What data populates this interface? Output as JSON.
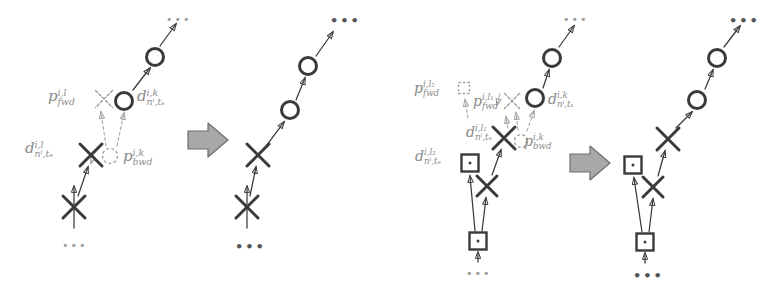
{
  "figure": {
    "background": "#ffffff",
    "stroke_solid": "#3a3a3a",
    "stroke_ghost": "#9d9d9d",
    "label_color": "#8a8a8a",
    "block_arrow_fill": "#a8a8a8",
    "block_arrow_stroke": "#6e6e6e",
    "ellipsis": "•••"
  },
  "diagrams": [
    {
      "id": "diagram-1",
      "name": "single-hypothesis-insertion",
      "before": {
        "name": "before-panel-1",
        "markers": [
          {
            "kind": "cross",
            "style": "solid",
            "x": 74,
            "y": 207,
            "size": 22
          },
          {
            "kind": "cross",
            "style": "solid",
            "x": 91,
            "y": 155,
            "size": 22
          },
          {
            "kind": "circle",
            "style": "solid",
            "x": 124,
            "y": 101,
            "size": 17
          },
          {
            "kind": "circle",
            "style": "solid",
            "x": 155,
            "y": 57,
            "size": 17
          },
          {
            "kind": "cross",
            "style": "ghost",
            "x": 104,
            "y": 99,
            "size": 17
          },
          {
            "kind": "circle",
            "style": "ghost",
            "x": 110,
            "y": 156,
            "size": 15
          }
        ],
        "links": [
          {
            "style": "solid",
            "from": [
              74,
              228
            ],
            "to": [
              74,
              186
            ]
          },
          {
            "style": "solid",
            "from": [
              78,
              196
            ],
            "to": [
              88,
              167
            ]
          },
          {
            "style": "solid",
            "from": [
              133,
              90
            ],
            "to": [
              150,
              68
            ]
          },
          {
            "style": "solid",
            "from": [
              160,
              46
            ],
            "to": [
              176,
              24
            ]
          },
          {
            "style": "dashed",
            "from": [
              106,
              146
            ],
            "to": [
              101,
              112
            ]
          },
          {
            "style": "dashed",
            "from": [
              117,
              146
            ],
            "to": [
              124,
              113
            ]
          },
          {
            "style": "dashed",
            "from": [
              96,
              150
            ],
            "to": [
              91,
              163
            ]
          }
        ],
        "ellipses": [
          {
            "x": 62,
            "y": 240,
            "variant": "faint"
          },
          {
            "x": 166,
            "y": 14,
            "variant": "faint"
          }
        ],
        "labels": [
          {
            "name": "p-fwd-label",
            "base": "p",
            "sup": "i,l",
            "sub": "fwd",
            "x": 48,
            "y": 88,
            "size": 15
          },
          {
            "name": "d-start-label",
            "base": "d",
            "sup": "i,k",
            "sub": "nⁱ,tₛ",
            "x": 137,
            "y": 88,
            "size": 15
          },
          {
            "name": "d-end-label",
            "base": "d",
            "sup": "i,l",
            "sub": "nⁱ,tₑ",
            "x": 25,
            "y": 140,
            "size": 15
          },
          {
            "name": "p-bwd-label",
            "base": "p",
            "sup": "i,k",
            "sub": "bwd",
            "x": 123,
            "y": 148,
            "size": 15
          }
        ]
      },
      "block_arrow": {
        "name": "transform-arrow-1",
        "x": 188,
        "y": 140
      },
      "after": {
        "name": "after-panel-1",
        "markers": [
          {
            "kind": "cross",
            "style": "solid",
            "x": 247,
            "y": 207,
            "size": 22
          },
          {
            "kind": "cross",
            "style": "solid",
            "x": 258,
            "y": 155,
            "size": 22
          },
          {
            "kind": "circle",
            "style": "solid",
            "x": 290,
            "y": 110,
            "size": 17
          },
          {
            "kind": "circle",
            "style": "solid",
            "x": 308,
            "y": 66,
            "size": 17
          },
          {
            "kind": "circle",
            "style": "solid",
            "x": 308,
            "y": 66,
            "size": 0
          }
        ],
        "links": [
          {
            "style": "solid",
            "from": [
              247,
              228
            ],
            "to": [
              247,
              186
            ]
          },
          {
            "style": "solid",
            "from": [
              250,
              196
            ],
            "to": [
              256,
              167
            ]
          },
          {
            "style": "solid",
            "from": [
              266,
              146
            ],
            "to": [
              284,
              122
            ]
          },
          {
            "style": "solid",
            "from": [
              296,
              100
            ],
            "to": [
              305,
              78
            ]
          },
          {
            "style": "solid",
            "from": [
              316,
              56
            ],
            "to": [
              333,
              32
            ]
          }
        ],
        "ellipses": [
          {
            "x": 235,
            "y": 240,
            "variant": "bold"
          },
          {
            "x": 330,
            "y": 14,
            "variant": "bold"
          }
        ],
        "labels": []
      }
    },
    {
      "id": "diagram-2",
      "name": "multi-hypothesis-branch-insertion",
      "before": {
        "name": "before-panel-2",
        "markers": [
          {
            "kind": "square",
            "style": "solid",
            "x": 478,
            "y": 241,
            "size": 17
          },
          {
            "kind": "cross",
            "style": "solid",
            "x": 487,
            "y": 186,
            "size": 20
          },
          {
            "kind": "square",
            "style": "solid",
            "x": 470,
            "y": 163,
            "size": 17
          },
          {
            "kind": "cross",
            "style": "solid",
            "x": 504,
            "y": 138,
            "size": 22
          },
          {
            "kind": "circle",
            "style": "solid",
            "x": 535,
            "y": 98,
            "size": 17
          },
          {
            "kind": "circle",
            "style": "solid",
            "x": 552,
            "y": 58,
            "size": 17
          },
          {
            "kind": "square",
            "style": "ghost",
            "x": 464,
            "y": 88,
            "size": 11
          },
          {
            "kind": "cross",
            "style": "ghost",
            "x": 512,
            "y": 101,
            "size": 15
          },
          {
            "kind": "circle",
            "style": "ghost",
            "x": 521,
            "y": 141,
            "size": 13
          }
        ],
        "links": [
          {
            "style": "solid",
            "from": [
              478,
              262
            ],
            "to": [
              478,
              252
            ]
          },
          {
            "style": "solid",
            "from": [
              475,
              231
            ],
            "to": [
              470,
              176
            ]
          },
          {
            "style": "solid",
            "from": [
              482,
              231
            ],
            "to": [
              486,
              198
            ]
          },
          {
            "style": "solid",
            "from": [
              492,
              175
            ],
            "to": [
              501,
              150
            ]
          },
          {
            "style": "solid",
            "from": [
              543,
              88
            ],
            "to": [
              549,
              70
            ]
          },
          {
            "style": "solid",
            "from": [
              559,
              47
            ],
            "to": [
              574,
              26
            ]
          },
          {
            "style": "dashed",
            "from": [
              518,
              130
            ],
            "to": [
              516,
              113
            ]
          },
          {
            "style": "dashed",
            "from": [
              527,
              131
            ],
            "to": [
              534,
              111
            ]
          },
          {
            "style": "dashed",
            "from": [
              508,
              128
            ],
            "to": [
              506,
              117
            ]
          },
          {
            "style": "dashed",
            "from": [
              468,
              118
            ],
            "to": [
              465,
              100
            ]
          },
          {
            "style": "dashed",
            "from": [
              500,
              94
            ],
            "to": [
              497,
              105
            ]
          }
        ],
        "ellipses": [
          {
            "x": 466,
            "y": 268,
            "variant": "faint"
          },
          {
            "x": 563,
            "y": 14,
            "variant": "faint"
          }
        ],
        "labels": [
          {
            "name": "p-fwd-l2-label",
            "base": "p",
            "sup": "i,l₂",
            "sub": "fwd",
            "x": 414,
            "y": 80,
            "size": 14
          },
          {
            "name": "p-fwd-l1-label",
            "base": "p",
            "sup": "i,l₁",
            "sub": "fwd",
            "x": 473,
            "y": 93,
            "size": 14
          },
          {
            "name": "d-start-label-2",
            "base": "d",
            "sup": "i,k",
            "sub": "nⁱ,tₛ",
            "x": 548,
            "y": 91,
            "size": 14
          },
          {
            "name": "d-end-l1-label",
            "base": "d",
            "sup": "i,l₁",
            "sub": "nⁱ,tₑ",
            "x": 466,
            "y": 124,
            "size": 14
          },
          {
            "name": "p-bwd-label-2",
            "base": "p",
            "sup": "i,k",
            "sub": "bwd",
            "x": 524,
            "y": 133,
            "size": 14
          },
          {
            "name": "d-end-l2-label",
            "base": "d",
            "sup": "i,l₂",
            "sub": "nⁱ,tₑ",
            "x": 415,
            "y": 148,
            "size": 14
          }
        ]
      },
      "block_arrow": {
        "name": "transform-arrow-2",
        "x": 570,
        "y": 163
      },
      "after": {
        "name": "after-panel-2",
        "markers": [
          {
            "kind": "square",
            "style": "solid",
            "x": 645,
            "y": 242,
            "size": 17
          },
          {
            "kind": "cross",
            "style": "solid",
            "x": 653,
            "y": 187,
            "size": 20
          },
          {
            "kind": "square",
            "style": "solid",
            "x": 633,
            "y": 165,
            "size": 17
          },
          {
            "kind": "cross",
            "style": "solid",
            "x": 668,
            "y": 139,
            "size": 22
          },
          {
            "kind": "circle",
            "style": "solid",
            "x": 697,
            "y": 100,
            "size": 17
          },
          {
            "kind": "circle",
            "style": "solid",
            "x": 717,
            "y": 58,
            "size": 17
          }
        ],
        "links": [
          {
            "style": "solid",
            "from": [
              645,
              263
            ],
            "to": [
              645,
              253
            ]
          },
          {
            "style": "solid",
            "from": [
              642,
              232
            ],
            "to": [
              634,
              178
            ]
          },
          {
            "style": "solid",
            "from": [
              649,
              232
            ],
            "to": [
              653,
              199
            ]
          },
          {
            "style": "solid",
            "from": [
              658,
              176
            ],
            "to": [
              665,
              151
            ]
          },
          {
            "style": "solid",
            "from": [
              676,
              128
            ],
            "to": [
              692,
              112
            ]
          },
          {
            "style": "solid",
            "from": [
              705,
              89
            ],
            "to": [
              713,
              70
            ]
          },
          {
            "style": "solid",
            "from": [
              724,
              47
            ],
            "to": [
              740,
              26
            ]
          }
        ],
        "ellipses": [
          {
            "x": 633,
            "y": 269,
            "variant": "bold"
          },
          {
            "x": 729,
            "y": 14,
            "variant": "bold"
          }
        ],
        "labels": []
      }
    }
  ]
}
